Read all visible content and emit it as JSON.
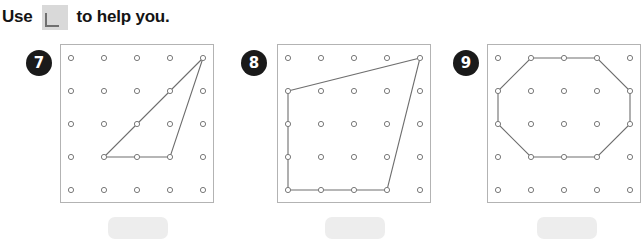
{
  "heading": {
    "text_before": "Use",
    "text_after": "to help you.",
    "icon": "square-corner-tool-icon"
  },
  "colors": {
    "badge_bg": "#1a1a1a",
    "badge_text": "#ffffff",
    "board_border": "#b3b3b3",
    "peg_stroke": "#7a7a7a",
    "peg_fill": "#ffffff",
    "band_stroke": "#6e6e6e",
    "answer_box": "#ededed",
    "tool_icon": "#d9d9d9"
  },
  "grid": {
    "rows": 5,
    "cols": 5,
    "spacing": 33
  },
  "problems": [
    {
      "number": "7",
      "shape_name": "triangle",
      "vertices": [
        [
          4,
          0
        ],
        [
          1,
          3
        ],
        [
          3,
          3
        ]
      ],
      "answer_value": ""
    },
    {
      "number": "8",
      "shape_name": "quadrilateral",
      "vertices": [
        [
          0,
          1
        ],
        [
          4,
          0
        ],
        [
          3,
          4
        ],
        [
          0,
          4
        ]
      ],
      "answer_value": ""
    },
    {
      "number": "9",
      "shape_name": "octagon",
      "vertices": [
        [
          1,
          0
        ],
        [
          3,
          0
        ],
        [
          4,
          1
        ],
        [
          4,
          2
        ],
        [
          3,
          3
        ],
        [
          1,
          3
        ],
        [
          0,
          2
        ],
        [
          0,
          1
        ]
      ],
      "answer_value": ""
    }
  ]
}
